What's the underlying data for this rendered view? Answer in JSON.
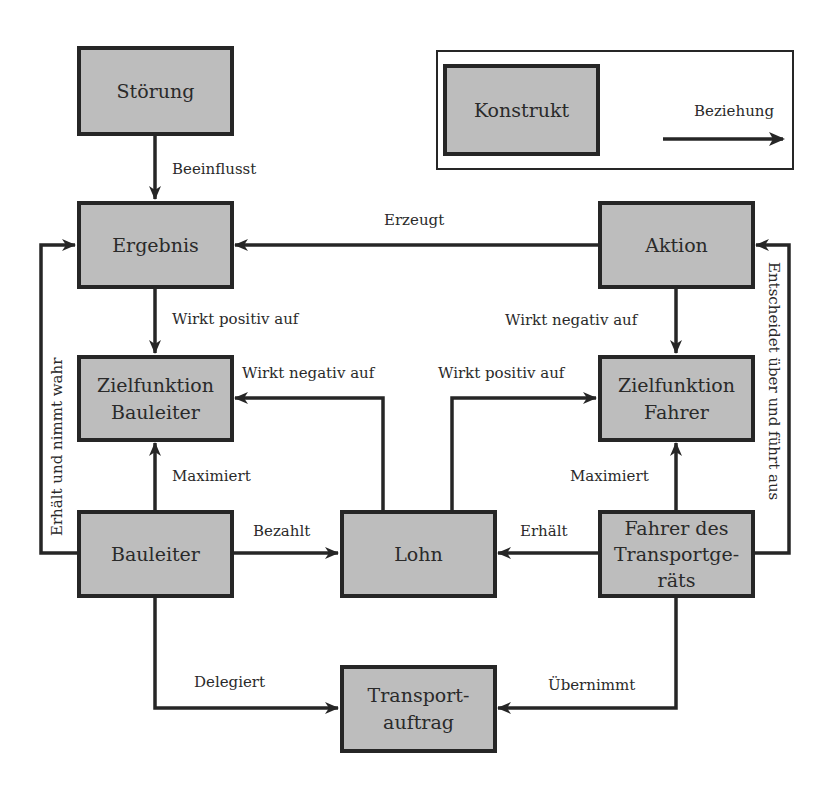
{
  "legend": {
    "construct_label": "Konstrukt",
    "relation_label": "Beziehung"
  },
  "nodes": {
    "stoerung": "Störung",
    "ergebnis": "Ergebnis",
    "zielfunktion_bauleiter": "Zielfunktion\nBauleiter",
    "bauleiter": "Bauleiter",
    "lohn": "Lohn",
    "fahrer": "Fahrer des\nTransportge-\nräts",
    "aktion": "Aktion",
    "zielfunktion_fahrer": "Zielfunktion\nFahrer",
    "transportauftrag": "Transport-\nauftrag"
  },
  "edges": {
    "stoerung_ergebnis": "Beeinflusst",
    "aktion_ergebnis": "Erzeugt",
    "ergebnis_zfb": "Wirkt positiv auf",
    "aktion_zff": "Wirkt negativ auf",
    "lohn_zfb": "Wirkt negativ auf",
    "lohn_zff": "Wirkt positiv auf",
    "bauleiter_zfb": "Maximiert",
    "fahrer_zff": "Maximiert",
    "bauleiter_lohn": "Bezahlt",
    "fahrer_lohn": "Erhält",
    "bauleiter_ergebnis": "Erhält und nimmt wahr",
    "fahrer_aktion": "Entscheidet über und führt aus",
    "bauleiter_auftrag": "Delegiert",
    "fahrer_auftrag": "Übernimmt"
  },
  "colors": {
    "box_fill": "#bdbdbd",
    "stroke": "#262626",
    "background": "#ffffff"
  }
}
